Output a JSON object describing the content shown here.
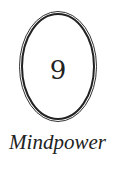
{
  "chapter": {
    "number": "9",
    "title": "Mindpower"
  },
  "colors": {
    "ink": "#222222",
    "background": "#ffffff"
  },
  "ornament": {
    "shape": "double-oval-frame"
  }
}
